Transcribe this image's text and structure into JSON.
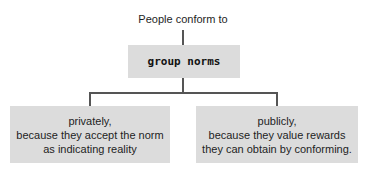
{
  "diagram": {
    "title": "People conform to",
    "root": {
      "label": "group norms"
    },
    "children": [
      {
        "lines": [
          "privately,",
          "because they accept the norm",
          "as indicating reality"
        ]
      },
      {
        "lines": [
          "publicly,",
          "because they value rewards",
          "they can obtain by conforming."
        ]
      }
    ],
    "colors": {
      "box_fill": "#dcdcdc",
      "connector": "#555555",
      "text": "#1e1e1e"
    }
  }
}
